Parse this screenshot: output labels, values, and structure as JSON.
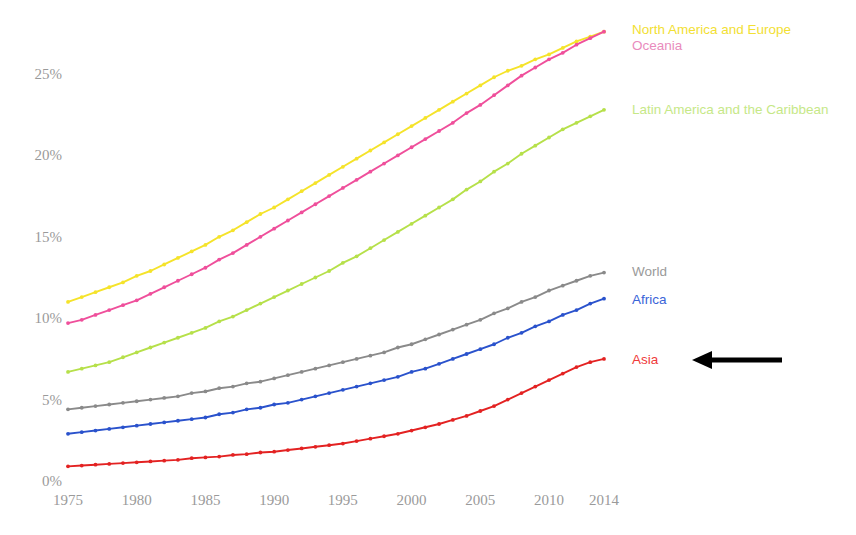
{
  "chart_data": {
    "type": "line",
    "title": "",
    "subtitle": "",
    "xlabel": "",
    "ylabel": "",
    "xlim": [
      1975,
      2014
    ],
    "ylim": [
      0,
      27.5
    ],
    "grid": false,
    "legend_position": "right-inline",
    "y_tick_labels": [
      "0%",
      "5%",
      "10%",
      "15%",
      "20%",
      "25%"
    ],
    "y_tick_values": [
      0,
      5,
      10,
      15,
      20,
      25
    ],
    "x_tick_labels": [
      "1975",
      "1980",
      "1985",
      "1990",
      "1995",
      "2000",
      "2005",
      "2010",
      "2014"
    ],
    "x_tick_values": [
      1975,
      1980,
      1985,
      1990,
      1995,
      2000,
      2005,
      2010,
      2014
    ],
    "x": [
      1975,
      1976,
      1977,
      1978,
      1979,
      1980,
      1981,
      1982,
      1983,
      1984,
      1985,
      1986,
      1987,
      1988,
      1989,
      1990,
      1991,
      1992,
      1993,
      1994,
      1995,
      1996,
      1997,
      1998,
      1999,
      2000,
      2001,
      2002,
      2003,
      2004,
      2005,
      2006,
      2007,
      2008,
      2009,
      2010,
      2011,
      2012,
      2013,
      2014
    ],
    "series": [
      {
        "name": "North America and Europe",
        "color": "#f5e32a",
        "label_color": "#f2e033",
        "marker": "dot",
        "values": [
          11.0,
          11.3,
          11.6,
          11.9,
          12.2,
          12.6,
          12.9,
          13.3,
          13.7,
          14.1,
          14.5,
          15.0,
          15.4,
          15.9,
          16.4,
          16.8,
          17.3,
          17.8,
          18.3,
          18.8,
          19.3,
          19.8,
          20.3,
          20.8,
          21.3,
          21.8,
          22.3,
          22.8,
          23.3,
          23.8,
          24.3,
          24.8,
          25.2,
          25.5,
          25.9,
          26.2,
          26.6,
          27.0,
          27.3,
          27.6
        ]
      },
      {
        "name": "Oceania",
        "color": "#ef4f9b",
        "label_color": "#e98bbd",
        "marker": "dot",
        "values": [
          9.7,
          9.9,
          10.2,
          10.5,
          10.8,
          11.1,
          11.5,
          11.9,
          12.3,
          12.7,
          13.1,
          13.6,
          14.0,
          14.5,
          15.0,
          15.5,
          16.0,
          16.5,
          17.0,
          17.5,
          18.0,
          18.5,
          19.0,
          19.5,
          20.0,
          20.5,
          21.0,
          21.5,
          22.0,
          22.6,
          23.1,
          23.7,
          24.3,
          24.9,
          25.4,
          25.9,
          26.3,
          26.8,
          27.2,
          27.6
        ]
      },
      {
        "name": "Latin America and the Caribbean",
        "color": "#b6e04a",
        "label_color": "#c6e887",
        "marker": "dot",
        "values": [
          6.7,
          6.9,
          7.1,
          7.3,
          7.6,
          7.9,
          8.2,
          8.5,
          8.8,
          9.1,
          9.4,
          9.8,
          10.1,
          10.5,
          10.9,
          11.3,
          11.7,
          12.1,
          12.5,
          12.9,
          13.4,
          13.8,
          14.3,
          14.8,
          15.3,
          15.8,
          16.3,
          16.8,
          17.3,
          17.9,
          18.4,
          19.0,
          19.5,
          20.1,
          20.6,
          21.1,
          21.6,
          22.0,
          22.4,
          22.8
        ]
      },
      {
        "name": "World",
        "color": "#8a8a8a",
        "label_color": "#9a9a9a",
        "marker": "dot",
        "values": [
          4.4,
          4.5,
          4.6,
          4.7,
          4.8,
          4.9,
          5.0,
          5.1,
          5.2,
          5.4,
          5.5,
          5.7,
          5.8,
          6.0,
          6.1,
          6.3,
          6.5,
          6.7,
          6.9,
          7.1,
          7.3,
          7.5,
          7.7,
          7.9,
          8.2,
          8.4,
          8.7,
          9.0,
          9.3,
          9.6,
          9.9,
          10.3,
          10.6,
          11.0,
          11.3,
          11.7,
          12.0,
          12.3,
          12.6,
          12.8
        ]
      },
      {
        "name": "Africa",
        "color": "#2a52cc",
        "label_color": "#3a64d8",
        "marker": "dot",
        "values": [
          2.9,
          3.0,
          3.1,
          3.2,
          3.3,
          3.4,
          3.5,
          3.6,
          3.7,
          3.8,
          3.9,
          4.1,
          4.2,
          4.4,
          4.5,
          4.7,
          4.8,
          5.0,
          5.2,
          5.4,
          5.6,
          5.8,
          6.0,
          6.2,
          6.4,
          6.7,
          6.9,
          7.2,
          7.5,
          7.8,
          8.1,
          8.4,
          8.8,
          9.1,
          9.5,
          9.8,
          10.2,
          10.5,
          10.9,
          11.2
        ]
      },
      {
        "name": "Asia",
        "color": "#e32222",
        "label_color": "#ef3b3b",
        "marker": "dot",
        "values": [
          0.9,
          0.95,
          1.0,
          1.05,
          1.1,
          1.15,
          1.2,
          1.25,
          1.3,
          1.4,
          1.45,
          1.5,
          1.6,
          1.65,
          1.75,
          1.8,
          1.9,
          2.0,
          2.1,
          2.2,
          2.3,
          2.45,
          2.6,
          2.75,
          2.9,
          3.1,
          3.3,
          3.5,
          3.75,
          4.0,
          4.3,
          4.6,
          5.0,
          5.4,
          5.8,
          6.2,
          6.6,
          7.0,
          7.3,
          7.5
        ]
      }
    ],
    "annotations": [
      {
        "name": "pointer-arrow",
        "type": "arrow",
        "direction": "left",
        "color": "#000000",
        "points_at": "Asia"
      }
    ]
  }
}
